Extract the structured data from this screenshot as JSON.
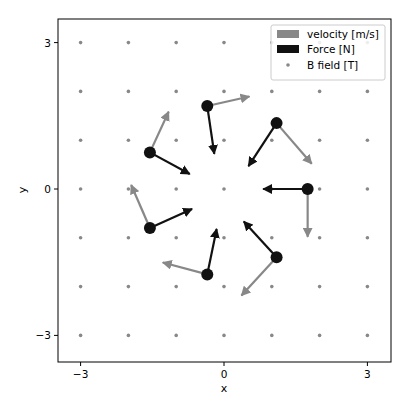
{
  "chart_data": {
    "type": "quiver",
    "title": "",
    "xlabel": "x",
    "ylabel": "y",
    "xlim": [
      -3.5,
      3.5
    ],
    "ylim": [
      -3.5,
      3.5
    ],
    "xticks": [
      -3,
      0,
      3
    ],
    "yticks": [
      -3,
      0,
      3
    ],
    "xtick_labels": [
      "−3",
      "0",
      "3"
    ],
    "ytick_labels": [
      "−3",
      "0",
      "3"
    ],
    "grid": false,
    "legend_position": "upper right",
    "legend": [
      {
        "label": "velocity [m/s]",
        "color": "#888888",
        "kind": "patch"
      },
      {
        "label": "Force [N]",
        "color": "#111111",
        "kind": "patch"
      },
      {
        "label": "B field [T]",
        "color": "#888888",
        "kind": "dot"
      }
    ],
    "b_field_grid": {
      "x": [
        -3,
        -2,
        -1,
        0,
        1,
        2,
        3
      ],
      "y": [
        -3,
        -2,
        -1,
        0,
        1,
        2,
        3
      ]
    },
    "particles": [
      {
        "x": -0.35,
        "y": 1.7,
        "vx": 0.9,
        "vy": 0.2,
        "fx": 0.15,
        "fy": -1.0
      },
      {
        "x": 1.1,
        "y": 1.35,
        "vx": 0.75,
        "vy": -0.85,
        "fx": -0.6,
        "fy": -0.9
      },
      {
        "x": 1.75,
        "y": 0.0,
        "vx": 0.0,
        "vy": -1.0,
        "fx": -0.95,
        "fy": 0.0
      },
      {
        "x": 1.1,
        "y": -1.4,
        "vx": -0.75,
        "vy": -0.8,
        "fx": -0.7,
        "fy": 0.75
      },
      {
        "x": -0.35,
        "y": -1.75,
        "vx": -0.95,
        "vy": 0.25,
        "fx": 0.2,
        "fy": 0.95
      },
      {
        "x": -1.55,
        "y": -0.8,
        "vx": -0.4,
        "vy": 0.9,
        "fx": 0.9,
        "fy": 0.4
      },
      {
        "x": -1.55,
        "y": 0.75,
        "vx": 0.4,
        "vy": 0.85,
        "fx": 0.85,
        "fy": -0.45
      }
    ]
  }
}
